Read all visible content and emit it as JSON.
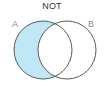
{
  "diagram": {
    "title": "NOT",
    "type": "venn",
    "highlighted_region": "A not B",
    "sets": [
      {
        "label": "A",
        "cx": 43,
        "cy": 50,
        "r": 29
      },
      {
        "label": "B",
        "cx": 67,
        "cy": 50,
        "r": 29
      }
    ],
    "colors": {
      "fill": "#bfe7f6",
      "stroke": "#4a4a4a",
      "title": "#333333",
      "label": "#8a8a8a"
    }
  }
}
